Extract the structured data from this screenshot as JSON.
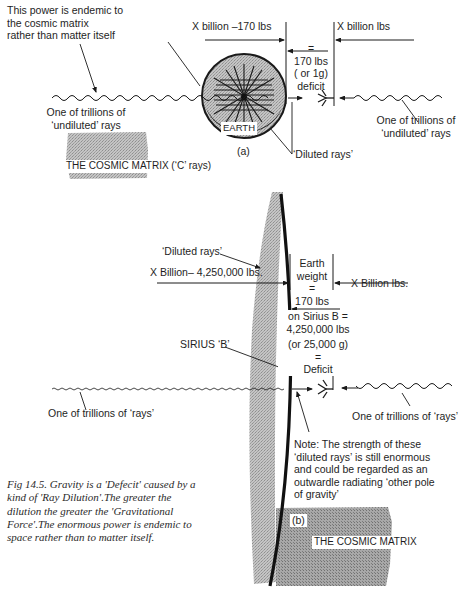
{
  "figure": {
    "caption": "Fig 14.5. Gravity is a 'Defecit' caused by a kind of 'Ray Dilution'.The greater the dilution the greater the 'Gravitational Force'.The enormous power is endemic to space rather than to matter itself.",
    "colors": {
      "ink": "#1a1a1a",
      "stipple": "#b9b9b9",
      "stipple_dark": "#9a9a9a",
      "paper": "#ffffff"
    }
  },
  "panel_a": {
    "tag": "(a)",
    "note_top_left": [
      "This power is endemic to",
      "the cosmic matrix",
      "rather than matter itself"
    ],
    "left_force": "X billion –170 lbs",
    "right_force": "X billion lbs",
    "deficit": [
      "=",
      "170 lbs",
      "( or 1g)",
      "deficit"
    ],
    "left_ray_label": [
      "One of trillions of",
      "‘undiluted’ rays"
    ],
    "right_ray_label": [
      "One of trillions of",
      "‘undiluted’ rays"
    ],
    "diluted_label": "‘Diluted rays’",
    "body_label": "EARTH",
    "matrix_label": "THE COSMIC MATRIX (‘C’ rays)"
  },
  "panel_b": {
    "tag": "(b)",
    "diluted_label": "‘Diluted rays’",
    "left_force": "X Billion– 4,250,000 lbs.",
    "right_force": "X Billion lbs.",
    "weight_block": [
      "Earth",
      "weight",
      "=",
      "170 lbs",
      "on Sirius B =",
      "4,250,000 lbs",
      "(or 25,000 g)",
      "=",
      "Deficit"
    ],
    "body_label": "SIRIUS ‘B’",
    "left_ray_label": "One of trillions of ‘rays’",
    "right_ray_label": "One of trillions of ‘rays’",
    "note": [
      "Note: The strength of these",
      "‘diluted rays’ is still enormous",
      "and could be regarded as an",
      "outwardle radiating ‘other pole",
      "of gravity’"
    ],
    "matrix_label": "THE COSMIC MATRIX"
  }
}
